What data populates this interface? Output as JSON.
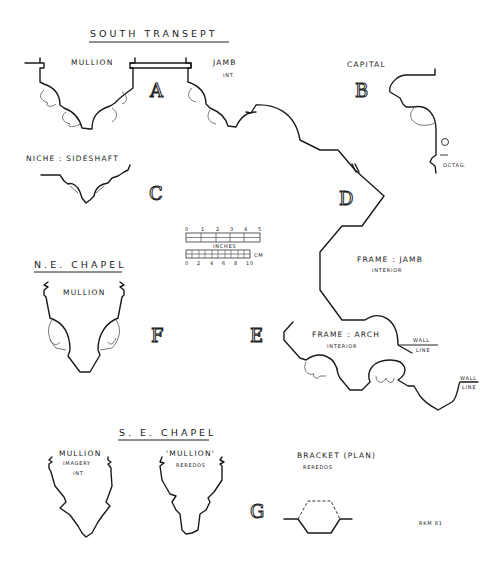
{
  "sheet": {
    "title": "SOUTH TRANSEPT",
    "signature": "RKM 81"
  },
  "sections": {
    "A": {
      "letter": "A",
      "labels": [
        "MULLION",
        "JAMB"
      ],
      "sublabel": "INT."
    },
    "B": {
      "letter": "B",
      "label": "CAPITAL",
      "note": "OCTAG."
    },
    "C": {
      "letter": "C",
      "label": "NICHE : SIDESHAFT"
    },
    "D": {
      "letter": "D",
      "label": "FRAME : JAMB",
      "sublabel": "INTERIOR",
      "wall": [
        "WALL",
        "LINE"
      ]
    },
    "E": {
      "letter": "E",
      "label": "FRAME : ARCH",
      "sublabel": "INTERIOR",
      "wall": [
        "WALL",
        "LINE"
      ]
    },
    "F": {
      "letter": "F",
      "group_title": "N.E. CHAPEL",
      "label": "MULLION"
    },
    "G": {
      "letter": "G",
      "group_title": "S. E. CHAPEL",
      "mullion1": {
        "label": "MULLION",
        "sub1": "IMAGERY",
        "sub2": "INT."
      },
      "mullion2": {
        "label": "'MULLION'",
        "sub1": "REREDOS"
      },
      "bracket": {
        "label": "BRACKET (PLAN)",
        "sub1": "REREDOS"
      }
    }
  },
  "scale_bar": {
    "inch_ticks": [
      "0",
      "1",
      "2",
      "3",
      "4",
      "5"
    ],
    "inch_label": "INCHES",
    "cm_label": "CM",
    "cm_ticks": [
      "0",
      "2",
      "4",
      "6",
      "8",
      "10"
    ]
  }
}
